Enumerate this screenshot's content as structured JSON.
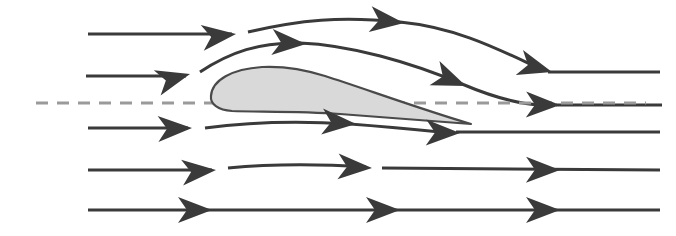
{
  "figure": {
    "title": "Airflow over an airfoil",
    "type": "technical-diagram",
    "width": 676,
    "height": 236,
    "background_color": "#ffffff"
  },
  "colors": {
    "streamline": "#3a3a3a",
    "arrowhead": "#3a3a3a",
    "chord_dash": "#9a9a9a",
    "airfoil_fill": "#d9d9d9",
    "airfoil_outline": "#4a4a4a",
    "background": "#ffffff"
  },
  "chord_line": {
    "name": "chord-reference-line",
    "style": "dashed",
    "color": "#9a9a9a",
    "dash_pattern": "12 9",
    "stroke_width": 3,
    "y": 103,
    "x_start": 36,
    "x_end": 646
  },
  "airfoil": {
    "name": "airfoil-cross-section",
    "fill": "#d9d9d9",
    "outline": "#4a4a4a",
    "leading_edge": [
      211,
      96
    ],
    "trailing_edge": [
      471,
      124
    ],
    "upper_peak": [
      288,
      67
    ],
    "chord_length_px": 260,
    "max_thickness_px": 35,
    "path": "M211,96 C212,80 232,69 262,67 C282,66 300,68 325,76 C360,87 420,109 471,124 C440,122 390,118 340,114 C300,111 255,112 232,111 C218,110 210,104 211,96 Z"
  },
  "streamlines": [
    {
      "id": 1,
      "name": "streamline-top-1",
      "description": "uppermost streamline, deflected downward past the airfoil",
      "row_y_left": 34,
      "path": "M88,34 L232,34 M248,32 C300,20 340,16 400,22 C452,27 492,46 530,64 M548,72 L660,72",
      "arrow_positions": [
        [
          236,
          34
        ],
        [
          404,
          23
        ],
        [
          552,
          72
        ]
      ],
      "stroke_width": 3.0
    },
    {
      "id": 2,
      "name": "streamline-top-2",
      "description": "streamline hugging the upper surface of the airfoil",
      "row_y_left": 76,
      "path": "M86,76 L186,76 M200,72 C230,52 260,42 300,43 C350,45 410,62 462,84 C495,98 520,104 540,105 M556,105 L662,105",
      "arrow_positions": [
        [
          190,
          74
        ],
        [
          306,
          44
        ],
        [
          466,
          86
        ],
        [
          560,
          105
        ]
      ],
      "stroke_width": 3.0
    },
    {
      "id": 3,
      "name": "streamline-bottom-1",
      "description": "streamline along the lower surface of the airfoil",
      "row_y_left": 128,
      "path": "M88,128 L188,128 M205,128 C250,122 300,121 350,124 C390,127 420,130 440,132 M456,132 L660,132",
      "arrow_positions": [
        [
          192,
          128
        ],
        [
          356,
          124
        ],
        [
          460,
          133
        ]
      ],
      "stroke_width": 3.0
    },
    {
      "id": 4,
      "name": "streamline-bottom-2",
      "description": "nearly straight streamline below the airfoil",
      "row_y_left": 170,
      "path": "M88,170 L212,170 M228,168 C270,164 320,164 366,167 M382,168 L660,170",
      "arrow_positions": [
        [
          216,
          170
        ],
        [
          372,
          168
        ],
        [
          560,
          170
        ]
      ],
      "stroke_width": 3.0
    },
    {
      "id": 5,
      "name": "streamline-freestream-bottom",
      "description": "undisturbed freestream streamline at the bottom",
      "row_y_left": 210,
      "path": "M88,210 L660,210",
      "arrow_positions": [
        [
          212,
          210
        ],
        [
          400,
          210
        ],
        [
          560,
          210
        ]
      ],
      "stroke_width": 3.0
    }
  ],
  "arrow_style": {
    "name": "barbed-arrowhead",
    "length_px": 34,
    "half_width_px": 13,
    "notch_px": 9,
    "description": "solid barbed arrowhead with concave rear notch"
  },
  "legend": {
    "visible": false,
    "items": []
  },
  "labels": {
    "visible": false,
    "items": []
  }
}
